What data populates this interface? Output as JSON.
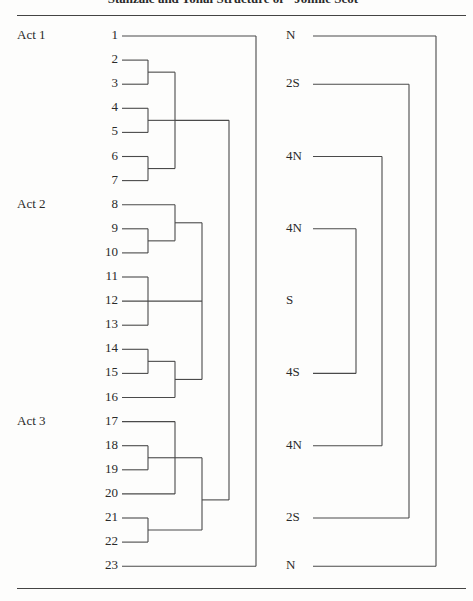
{
  "title": "Stanzaic and Tonal Structure of \"Johnie Scot\"",
  "acts": [
    {
      "label": "Act 1",
      "row": 1
    },
    {
      "label": "Act 2",
      "row": 8
    },
    {
      "label": "Act 3",
      "row": 17
    }
  ],
  "stanzas": [
    "1",
    "2",
    "3",
    "4",
    "5",
    "6",
    "7",
    "8",
    "9",
    "10",
    "11",
    "12",
    "13",
    "14",
    "15",
    "16",
    "17",
    "18",
    "19",
    "20",
    "21",
    "22",
    "23"
  ],
  "tonal": [
    {
      "label": "N",
      "row": 1
    },
    {
      "label": "2S",
      "row": 3
    },
    {
      "label": "4N",
      "row": 6
    },
    {
      "label": "4N",
      "row": 9
    },
    {
      "label": "S",
      "row": 12
    },
    {
      "label": "4S",
      "row": 15
    },
    {
      "label": "4N",
      "row": 18
    },
    {
      "label": "2S",
      "row": 21
    },
    {
      "label": "N",
      "row": 23
    }
  ],
  "stanza_groupings": [
    {
      "level": 1,
      "members": [
        2,
        3
      ]
    },
    {
      "level": 1,
      "members": [
        4,
        5
      ]
    },
    {
      "level": 1,
      "members": [
        6,
        7
      ]
    },
    {
      "level": 2,
      "members": [
        [
          2,
          3
        ],
        [
          4,
          5
        ],
        [
          6,
          7
        ]
      ]
    },
    {
      "level": 1,
      "members": [
        9,
        10
      ]
    },
    {
      "level": 2,
      "members": [
        8,
        [
          9,
          10
        ]
      ]
    },
    {
      "level": 1,
      "members": [
        11,
        12,
        13
      ]
    },
    {
      "level": 1,
      "members": [
        14,
        15
      ]
    },
    {
      "level": 2,
      "members": [
        [
          14,
          15
        ],
        16
      ]
    },
    {
      "level": 3,
      "members": [
        [
          8,
          9,
          10
        ],
        [
          11,
          12,
          13
        ],
        [
          14,
          15,
          16
        ]
      ]
    },
    {
      "level": 1,
      "members": [
        18,
        19
      ]
    },
    {
      "level": 2,
      "members": [
        17,
        [
          18,
          19
        ],
        20
      ]
    },
    {
      "level": 1,
      "members": [
        21,
        22
      ]
    },
    {
      "level": 3,
      "members": [
        [
          17,
          18,
          19,
          20
        ],
        [
          21,
          22
        ]
      ]
    },
    {
      "level": 4,
      "members": [
        "Act 1 (2-7)",
        "Act 3 (17-22)"
      ]
    },
    {
      "level": 5,
      "members": [
        1,
        23
      ]
    }
  ],
  "tonal_pairs": [
    {
      "outer": [
        "N",
        "N"
      ],
      "rows": [
        1,
        23
      ]
    },
    {
      "outer": [
        "2S",
        "2S"
      ],
      "rows": [
        3,
        21
      ]
    },
    {
      "outer": [
        "4N",
        "4N"
      ],
      "rows": [
        6,
        18
      ]
    },
    {
      "outer": [
        "4N",
        "4S"
      ],
      "rows": [
        9,
        15
      ]
    }
  ]
}
